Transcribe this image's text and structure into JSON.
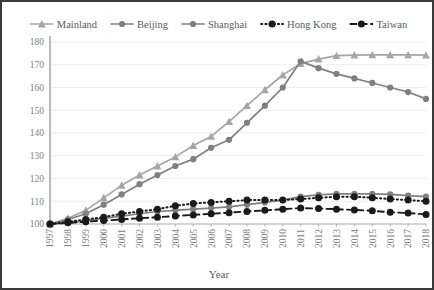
{
  "chart_data": {
    "type": "line",
    "title": "",
    "xlabel": "Year",
    "ylabel": "",
    "grid": true,
    "legend_position": "top",
    "ylim": [
      95,
      183
    ],
    "yticks": [
      100,
      110,
      120,
      130,
      140,
      150,
      160,
      170,
      180
    ],
    "categories": [
      "1997",
      "1998",
      "1999",
      "2000",
      "2001",
      "2002",
      "2003",
      "2004",
      "2005",
      "2006",
      "2007",
      "2008",
      "2009",
      "2010",
      "2011",
      "2012",
      "2013",
      "2014",
      "2015",
      "2016",
      "2017",
      "2018"
    ],
    "series": [
      {
        "name": "Mainland",
        "marker": "triangle",
        "color": "#a6a6a6",
        "dash": "solid",
        "values": [
          100.0,
          102.5,
          106.0,
          111.5,
          117.0,
          121.5,
          125.5,
          129.5,
          134.5,
          138.5,
          145.0,
          152.0,
          159.0,
          165.5,
          170.5,
          172.5,
          174.0,
          174.2,
          174.3,
          174.3,
          174.3,
          174.2
        ]
      },
      {
        "name": "Beijing",
        "marker": "circle",
        "color": "#7f7f7f",
        "dash": "solid",
        "values": [
          100.0,
          100.5,
          101.5,
          102.5,
          103.5,
          104.5,
          105.5,
          106.0,
          106.5,
          107.0,
          107.5,
          108.5,
          109.5,
          110.5,
          112.0,
          112.8,
          113.2,
          113.3,
          113.2,
          113.0,
          112.5,
          112.0
        ]
      },
      {
        "name": "Shanghai",
        "marker": "circle",
        "color": "#808080",
        "dash": "solid",
        "values": [
          100.0,
          102.0,
          104.5,
          108.5,
          113.0,
          117.5,
          121.5,
          125.5,
          128.5,
          133.5,
          137.0,
          144.5,
          152.0,
          160.0,
          171.5,
          168.5,
          166.0,
          164.0,
          162.0,
          160.0,
          158.0,
          155.0
        ]
      },
      {
        "name": "Hong Kong",
        "marker": "circle-filled",
        "color": "#1a1a1a",
        "dash": "dotted",
        "values": [
          100.0,
          101.0,
          102.0,
          103.0,
          104.5,
          105.5,
          106.5,
          108.0,
          109.0,
          109.5,
          110.0,
          110.5,
          110.5,
          110.5,
          111.0,
          111.5,
          112.0,
          112.0,
          111.5,
          111.0,
          110.5,
          110.0
        ]
      },
      {
        "name": "Taiwan",
        "marker": "circle-filled",
        "color": "#1a1a1a",
        "dash": "dashed",
        "values": [
          100.0,
          100.5,
          101.0,
          101.5,
          102.0,
          102.5,
          103.0,
          103.5,
          104.0,
          104.5,
          105.0,
          105.5,
          106.0,
          106.5,
          107.0,
          106.8,
          106.5,
          106.2,
          105.8,
          105.2,
          104.8,
          104.2
        ]
      }
    ]
  },
  "axis": {
    "x_title": "Year"
  }
}
